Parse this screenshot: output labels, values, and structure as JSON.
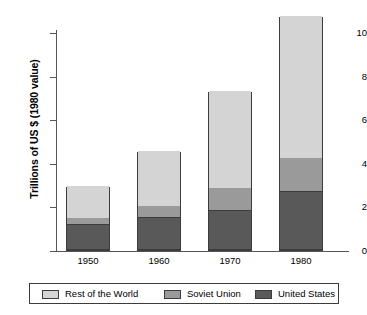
{
  "chart_data": {
    "type": "bar",
    "subtype": "stacked-vertical",
    "title": "",
    "xlabel": "",
    "ylabel": "Trillions of US $ (1980 value)",
    "categories": [
      "1950",
      "1960",
      "1970",
      "1980"
    ],
    "series": [
      {
        "name": "United States",
        "color": "#595959",
        "values": [
          1.15,
          1.45,
          1.8,
          2.65
        ]
      },
      {
        "name": "Soviet Union",
        "color": "#9a9a9a",
        "values": [
          0.3,
          0.55,
          1.05,
          1.55
        ]
      },
      {
        "name": "Rest of the World",
        "color": "#d4d4d4",
        "values": [
          1.5,
          2.55,
          4.45,
          6.55
        ]
      }
    ],
    "stack_order_bottom_to_top": [
      "United States",
      "Soviet Union",
      "Rest of the World"
    ],
    "totals": [
      2.95,
      4.55,
      7.3,
      10.75
    ],
    "ylim": [
      0,
      11.2
    ],
    "yticks": [
      0,
      2,
      4,
      6,
      8,
      10
    ],
    "ytick_labels": [
      "0",
      "2",
      "4",
      "6",
      "8",
      "10"
    ],
    "grid": false,
    "legend_position": "bottom",
    "legend_entries": [
      "Rest of the World",
      "Soviet Union",
      "United States"
    ]
  },
  "axes": {
    "y_label": "Trillions of US $ (1980 value)",
    "y_tick_labels": [
      "10",
      "8",
      "6",
      "4",
      "2",
      "0"
    ],
    "x_tick_labels": [
      "1950",
      "1960",
      "1970",
      "1980"
    ]
  },
  "legend": {
    "items": [
      {
        "label": "Rest of the World",
        "color": "#d4d4d4"
      },
      {
        "label": "Soviet Union",
        "color": "#9a9a9a"
      },
      {
        "label": "United States",
        "color": "#595959"
      }
    ]
  },
  "colors": {
    "rest_of_world": "#d4d4d4",
    "soviet_union": "#9a9a9a",
    "united_states": "#595959",
    "outline": "#3c3c3c",
    "axis": "#555555",
    "background": "#ffffff"
  }
}
